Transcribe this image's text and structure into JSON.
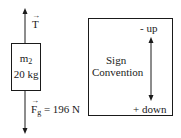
{
  "free_body": {
    "mass_label": "m",
    "mass_sub": "2",
    "mass_value": "20 kg",
    "tension_label": "T",
    "gravity_label": "F",
    "gravity_sub": "g",
    "gravity_value": "= 196 N"
  },
  "sign_convention": {
    "title_line1": "Sign",
    "title_line2": "Convention",
    "up_label": "- up",
    "down_label": "+ down"
  },
  "colors": {
    "line": "#1a1a1a",
    "background": "#ffffff"
  }
}
